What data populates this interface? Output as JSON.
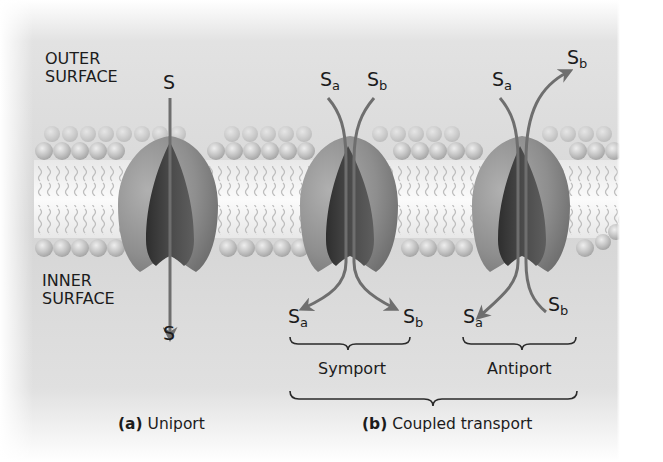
{
  "figure": {
    "regions": {
      "outer_label_line1": "OUTER",
      "outer_label_line2": "SURFACE",
      "inner_label_line1": "INNER",
      "inner_label_line2": "SURFACE"
    },
    "panels": {
      "uniport": {
        "substrate_top": "S",
        "substrate_bottom": "S",
        "caption_letter": "(a)",
        "caption_text": " Uniport"
      },
      "symport": {
        "top_a_base": "S",
        "top_a_sub": "a",
        "top_b_base": "S",
        "top_b_sub": "b",
        "bottom_a_base": "S",
        "bottom_a_sub": "a",
        "bottom_b_base": "S",
        "bottom_b_sub": "b",
        "label": "Symport"
      },
      "antiport": {
        "top_a_base": "S",
        "top_a_sub": "a",
        "top_b_base": "S",
        "top_b_sub": "b",
        "bottom_a_base": "S",
        "bottom_a_sub": "a",
        "bottom_b_base": "S",
        "bottom_b_sub": "b",
        "label": "Antiport"
      },
      "coupled": {
        "caption_letter": "(b)",
        "caption_text": " Coupled transport"
      }
    },
    "colors": {
      "background_gray": "#d9d9d9",
      "protein_outer": "#8f8f8f",
      "protein_inner": "#3c3c3c",
      "arrow": "#6e6e6e",
      "text": "#1c1c1c"
    }
  }
}
